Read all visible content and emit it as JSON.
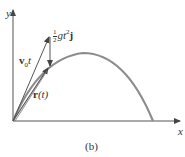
{
  "figure": {
    "caption": "(b)",
    "axes": {
      "x_label": "x",
      "y_label": "y"
    },
    "labels": {
      "velocity_vector": {
        "main": "v",
        "sub": "0",
        "suffix": "t"
      },
      "gravity_term": {
        "num": "1",
        "den": "2",
        "body": "gt",
        "sup": "2",
        "unit": "j"
      },
      "position_vector": {
        "main": "r",
        "arg": "(t)"
      }
    },
    "colors": {
      "curve": "#8c8c8c",
      "vectors": "#555555",
      "axes": "#555555"
    }
  }
}
